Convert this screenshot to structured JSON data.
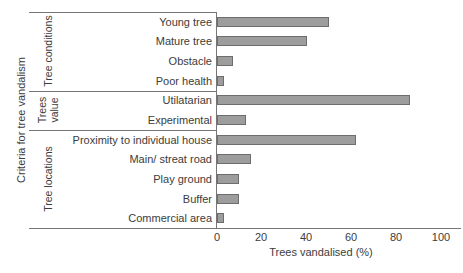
{
  "chart_data": {
    "type": "bar",
    "orientation": "horizontal",
    "xlabel": "Trees vandalised (%)",
    "ylabel": "Criteria for tree vandalism",
    "xlim": [
      0,
      100
    ],
    "xticks": [
      0,
      20,
      40,
      60,
      80,
      100
    ],
    "grid": false,
    "legend": false,
    "groups": [
      {
        "label": "Tree conditions",
        "categories": [
          "Young tree",
          "Mature tree",
          "Obstacle",
          "Poor health"
        ],
        "values": [
          50,
          40,
          7,
          3
        ]
      },
      {
        "label": "Trees\nvalue",
        "categories": [
          "Utilatarian",
          "Experimental"
        ],
        "values": [
          86,
          13
        ]
      },
      {
        "label": "Tree locations",
        "categories": [
          "Proximity to individual house",
          "Main/ streat road",
          "Play ground",
          "Buffer",
          "Commercial area"
        ],
        "values": [
          62,
          15,
          10,
          10,
          3
        ]
      }
    ],
    "bar_color": "#9d9d9d",
    "bar_border_color": "#6d6d6d",
    "axis_color": "#767676",
    "text_color": "#3c3c3c"
  }
}
